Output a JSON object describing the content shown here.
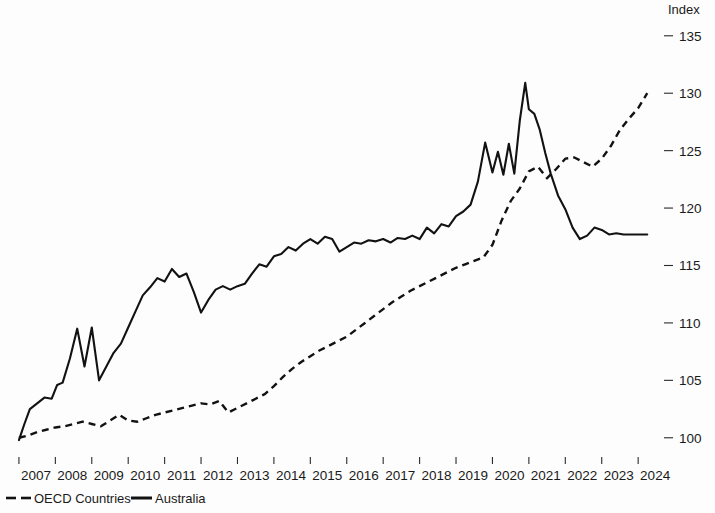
{
  "chart_data": {
    "type": "line",
    "title": "",
    "subtitle": "",
    "xlabel": "",
    "ylabel": "",
    "unit_label": "Index",
    "xlim": [
      2006.7,
      2024.6
    ],
    "ylim": [
      98.5,
      136.2
    ],
    "yticks": [
      100,
      105,
      110,
      115,
      120,
      125,
      130,
      135
    ],
    "ytick_labels": [
      "100",
      "105",
      "110",
      "115",
      "120",
      "125",
      "130",
      "135"
    ],
    "xticks": [
      2007,
      2008,
      2009,
      2010,
      2011,
      2012,
      2013,
      2014,
      2015,
      2016,
      2017,
      2018,
      2019,
      2020,
      2021,
      2022,
      2023,
      2024
    ],
    "xtick_labels": [
      "2007",
      "2008",
      "2009",
      "2010",
      "2011",
      "2012",
      "2013",
      "2014",
      "2015",
      "2016",
      "2017",
      "2018",
      "2019",
      "2020",
      "2021",
      "2022",
      "2023",
      "2024"
    ],
    "grid": false,
    "legend_position": "bottom-left",
    "y_axis_side": "right",
    "series": [
      {
        "name": "OECD Countries",
        "style": "dashed",
        "color": "#121212",
        "x": [
          2007.0,
          2007.25,
          2007.5,
          2007.75,
          2008.0,
          2008.25,
          2008.5,
          2008.75,
          2009.0,
          2009.25,
          2009.5,
          2009.75,
          2010.0,
          2010.25,
          2010.5,
          2010.75,
          2011.0,
          2011.25,
          2011.5,
          2011.75,
          2012.0,
          2012.25,
          2012.5,
          2012.75,
          2013.0,
          2013.25,
          2013.5,
          2013.75,
          2014.0,
          2014.25,
          2014.5,
          2014.75,
          2015.0,
          2015.25,
          2015.5,
          2015.75,
          2016.0,
          2016.25,
          2016.5,
          2016.75,
          2017.0,
          2017.25,
          2017.5,
          2017.75,
          2018.0,
          2018.25,
          2018.5,
          2018.75,
          2019.0,
          2019.25,
          2019.5,
          2019.75,
          2020.0,
          2020.25,
          2020.5,
          2020.75,
          2021.0,
          2021.25,
          2021.5,
          2021.75,
          2022.0,
          2022.25,
          2022.5,
          2022.75,
          2023.0,
          2023.25,
          2023.5,
          2023.75,
          2024.0,
          2024.25
        ],
        "values": [
          100.0,
          100.2,
          100.5,
          100.7,
          100.9,
          101.0,
          101.2,
          101.4,
          101.2,
          101.0,
          101.5,
          102.0,
          101.5,
          101.4,
          101.7,
          102.0,
          102.2,
          102.4,
          102.6,
          102.8,
          103.0,
          102.9,
          103.2,
          102.2,
          102.6,
          103.0,
          103.4,
          103.8,
          104.5,
          105.3,
          106.0,
          106.6,
          107.1,
          107.6,
          108.0,
          108.4,
          108.8,
          109.4,
          110.0,
          110.6,
          111.2,
          111.8,
          112.3,
          112.8,
          113.2,
          113.6,
          114.0,
          114.4,
          114.8,
          115.1,
          115.4,
          115.7,
          116.8,
          118.9,
          120.6,
          121.7,
          123.2,
          123.6,
          122.6,
          123.4,
          124.3,
          124.4,
          124.0,
          123.6,
          124.3,
          125.4,
          126.8,
          127.8,
          128.7,
          130.0
        ]
      },
      {
        "name": "Australia",
        "style": "solid",
        "color": "#121212",
        "x": [
          2007.0,
          2007.15,
          2007.3,
          2007.5,
          2007.7,
          2007.9,
          2008.05,
          2008.2,
          2008.4,
          2008.6,
          2008.8,
          2009.0,
          2009.2,
          2009.4,
          2009.6,
          2009.8,
          2010.0,
          2010.2,
          2010.4,
          2010.6,
          2010.8,
          2011.0,
          2011.2,
          2011.4,
          2011.6,
          2011.8,
          2012.0,
          2012.2,
          2012.4,
          2012.6,
          2012.8,
          2013.0,
          2013.2,
          2013.4,
          2013.6,
          2013.8,
          2014.0,
          2014.2,
          2014.4,
          2014.6,
          2014.8,
          2015.0,
          2015.2,
          2015.4,
          2015.6,
          2015.8,
          2016.0,
          2016.2,
          2016.4,
          2016.6,
          2016.8,
          2017.0,
          2017.2,
          2017.4,
          2017.6,
          2017.8,
          2018.0,
          2018.2,
          2018.4,
          2018.6,
          2018.8,
          2019.0,
          2019.2,
          2019.4,
          2019.6,
          2019.8,
          2020.0,
          2020.15,
          2020.3,
          2020.45,
          2020.6,
          2020.75,
          2020.9,
          2021.0,
          2021.15,
          2021.3,
          2021.45,
          2021.6,
          2021.8,
          2022.0,
          2022.2,
          2022.4,
          2022.6,
          2022.8,
          2023.0,
          2023.2,
          2023.4,
          2023.6,
          2023.8,
          2024.0,
          2024.25
        ],
        "values": [
          99.8,
          101.2,
          102.5,
          103.0,
          103.5,
          103.4,
          104.6,
          104.8,
          106.9,
          109.5,
          106.2,
          109.6,
          105.0,
          106.2,
          107.4,
          108.2,
          109.6,
          111.0,
          112.4,
          113.1,
          113.9,
          113.6,
          114.7,
          114.0,
          114.3,
          112.7,
          110.9,
          112.0,
          112.9,
          113.2,
          112.9,
          113.2,
          113.4,
          114.3,
          115.1,
          114.9,
          115.8,
          116.0,
          116.6,
          116.3,
          116.9,
          117.3,
          116.9,
          117.5,
          117.3,
          116.2,
          116.6,
          117.0,
          116.9,
          117.2,
          117.1,
          117.3,
          117.0,
          117.4,
          117.3,
          117.6,
          117.3,
          118.3,
          117.8,
          118.6,
          118.4,
          119.3,
          119.7,
          120.3,
          122.3,
          125.7,
          123.1,
          124.9,
          122.9,
          125.6,
          123.0,
          127.6,
          130.9,
          128.6,
          128.2,
          126.8,
          124.8,
          123.0,
          121.1,
          119.9,
          118.3,
          117.3,
          117.6,
          118.3,
          118.1,
          117.7,
          117.8,
          117.7,
          117.7,
          117.7,
          117.7
        ]
      }
    ]
  },
  "legend": {
    "items": [
      {
        "label": "OECD Countries",
        "style": "dashed"
      },
      {
        "label": "Australia",
        "style": "solid"
      }
    ]
  },
  "axis": {
    "unit_label": "Index"
  }
}
